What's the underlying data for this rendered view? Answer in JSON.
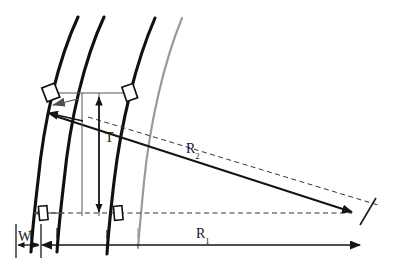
{
  "figure": {
    "background_color": "#ffffff",
    "width": 401,
    "height": 274
  },
  "labels": {
    "thickness": {
      "symbol": "T",
      "subscript": ""
    },
    "radius_inner": {
      "symbol": "R",
      "subscript": "2"
    },
    "radius_outer": {
      "symbol": "R",
      "subscript": "1"
    },
    "width": {
      "symbol": "W",
      "subscript": "m"
    }
  },
  "colors": {
    "curve_black": "#111111",
    "curve_gray": "#9a9a9a",
    "dimension_line": "#222222",
    "dashed_line": "#333333",
    "thin_line": "#555555"
  },
  "elements": {
    "curves": [
      {
        "name": "curve-1",
        "color": "#111111",
        "width": 3.1
      },
      {
        "name": "curve-2",
        "color": "#111111",
        "width": 3.1
      },
      {
        "name": "curve-3",
        "color": "#111111",
        "width": 3.1
      },
      {
        "name": "curve-4",
        "color": "#9a9a9a",
        "width": 2.2
      }
    ],
    "markers": [
      {
        "name": "marker-top-left"
      },
      {
        "name": "marker-top-right"
      },
      {
        "name": "marker-bottom-left"
      },
      {
        "name": "marker-bottom-right"
      }
    ],
    "dimensions": [
      {
        "name": "dimension-T",
        "orientation": "vertical",
        "label": "T"
      },
      {
        "name": "dimension-R2",
        "orientation": "oblique",
        "label": "R2"
      },
      {
        "name": "dimension-R1",
        "orientation": "horizontal",
        "label": "R1"
      },
      {
        "name": "dimension-W",
        "orientation": "horizontal",
        "label": "Wm"
      }
    ]
  }
}
